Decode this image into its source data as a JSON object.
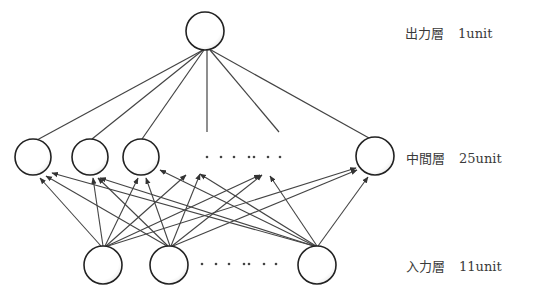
{
  "layers": {
    "output": {
      "name": "出力層",
      "units": "1unit"
    },
    "hidden": {
      "name": "中間層",
      "units": "25unit"
    },
    "input": {
      "name": "入力層",
      "units": "11unit"
    }
  },
  "colors": {
    "stroke": "#333333",
    "background": "#ffffff"
  },
  "ellipsis_hidden": "· · · ·· · ·",
  "ellipsis_input": "· · · ·· · ·"
}
